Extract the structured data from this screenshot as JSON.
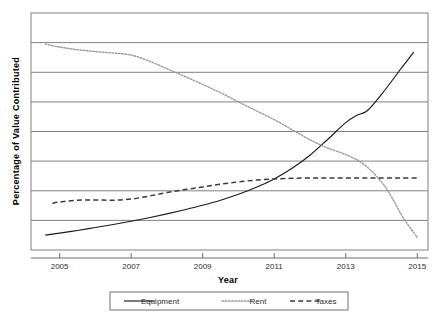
{
  "chart_data": {
    "type": "line",
    "title": "",
    "subtitle": "",
    "xlabel": "Year",
    "ylabel": "Percentage of Value Contributed",
    "xlim": [
      2004.2,
      2015.3
    ],
    "ylim": [
      0,
      80
    ],
    "xticks": [
      2005,
      2007,
      2009,
      2011,
      2013,
      2015
    ],
    "xtick_labels": [
      "2005",
      "2007",
      "2009",
      "2011",
      "2013",
      "2015"
    ],
    "yticks": [
      0,
      10,
      20,
      30,
      40,
      50,
      60,
      70,
      80
    ],
    "ytick_labels": [
      "",
      "",
      "",
      "",
      "",
      "",
      "",
      "",
      ""
    ],
    "grid": "horizontal",
    "legend_position": "below-axes",
    "plot_background": "#ffffff",
    "frame_color": "#808080",
    "gridline_color": "#808080",
    "series": [
      {
        "name": "Equipment",
        "linestyle": "solid",
        "color": "#1a1a1a",
        "x": [
          2004.6,
          2005,
          2005.5,
          2006,
          2006.5,
          2007,
          2007.5,
          2008,
          2008.5,
          2009,
          2009.5,
          2010,
          2010.5,
          2011,
          2011.5,
          2012,
          2012.5,
          2013,
          2013.3,
          2013.6,
          2014,
          2014.5,
          2014.9
        ],
        "values": [
          5.0,
          5.7,
          6.6,
          7.6,
          8.6,
          9.7,
          10.9,
          12.2,
          13.6,
          15.1,
          16.8,
          18.8,
          21.2,
          24.0,
          27.6,
          32.0,
          37.4,
          43.0,
          45.4,
          47.0,
          52.5,
          60.5,
          66.8
        ]
      },
      {
        "name": "Rent",
        "linestyle": "dotted",
        "color": "#9a9a9a",
        "x": [
          2004.6,
          2005,
          2005.5,
          2006,
          2006.5,
          2007,
          2007.5,
          2008,
          2008.5,
          2009,
          2009.5,
          2010,
          2010.5,
          2011,
          2011.5,
          2012,
          2012.5,
          2013,
          2013.5,
          2014,
          2014.3,
          2014.6,
          2015
        ],
        "values": [
          69.5,
          68.5,
          67.6,
          67.0,
          66.5,
          65.8,
          63.8,
          61.2,
          58.6,
          55.9,
          53.1,
          50.0,
          47.0,
          44.0,
          40.6,
          37.2,
          34.4,
          32.2,
          29.0,
          23.0,
          17.5,
          11.0,
          4.2
        ]
      },
      {
        "name": "Taxes",
        "linestyle": "dashed",
        "color": "#3a3a3a",
        "x": [
          2004.8,
          2005,
          2005.5,
          2006,
          2006.5,
          2007,
          2007.5,
          2008,
          2008.5,
          2009,
          2009.5,
          2010,
          2010.5,
          2011,
          2011.5,
          2012,
          2012.5,
          2013,
          2013.5,
          2014,
          2014.5,
          2015
        ],
        "values": [
          15.8,
          16.2,
          16.8,
          16.9,
          16.8,
          17.2,
          18.2,
          19.4,
          20.4,
          21.3,
          22.2,
          23.0,
          23.6,
          24.0,
          24.2,
          24.3,
          24.3,
          24.3,
          24.3,
          24.3,
          24.3,
          24.3
        ]
      }
    ],
    "legend_entries": [
      {
        "label": "Equipment",
        "linestyle": "solid",
        "color": "#1a1a1a"
      },
      {
        "label": "Rent",
        "linestyle": "dotted",
        "color": "#9a9a9a"
      },
      {
        "label": "Taxes",
        "linestyle": "dashed",
        "color": "#3a3a3a"
      }
    ]
  }
}
